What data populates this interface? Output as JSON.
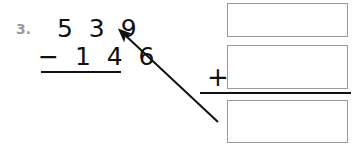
{
  "worksheet": {
    "problem_number": "3.",
    "subtraction": {
      "minuend": "5 3 9",
      "subtrahend": "− 1 4 6",
      "minuend_value": 539,
      "subtrahend_value": 146,
      "operator": "−"
    },
    "check_addition": {
      "plus_sign": "+",
      "boxes": [
        {
          "name": "difference-box",
          "value": ""
        },
        {
          "name": "subtrahend-box",
          "value": ""
        },
        {
          "name": "sum-box",
          "value": ""
        }
      ]
    },
    "annotation": {
      "arrow": "arrow-pointing-to-minuend",
      "from": "bottom-answer-box",
      "to": "minuend-539"
    }
  },
  "colors": {
    "ink": "#111111",
    "problem_number": "#9a9a9a",
    "box_border": "#9b9b9b",
    "page": "#ffffff"
  }
}
